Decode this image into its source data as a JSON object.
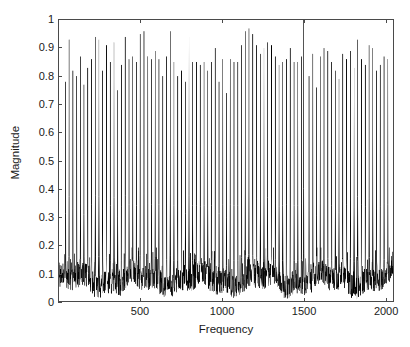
{
  "chart_data": {
    "type": "line",
    "title": "",
    "subtitle": "",
    "xlabel": "Frequency",
    "ylabel": "Magnitude",
    "xlim": [
      0,
      2048
    ],
    "ylim": [
      0,
      1
    ],
    "grid": false,
    "legend": null,
    "annotations": [],
    "series_color": "#000000",
    "axis_color": "#4a4a4a",
    "xticks": [
      500,
      1000,
      1500,
      2000
    ],
    "xtick_labels": [
      "500",
      "1000",
      "1500",
      "2000"
    ],
    "yticks": [
      0,
      0.1,
      0.2,
      0.3,
      0.4,
      0.5,
      0.6,
      0.7,
      0.8,
      0.9,
      1
    ],
    "ytick_labels": [
      "0",
      "0.1",
      "0.2",
      "0.3",
      "0.4",
      "0.5",
      "0.6",
      "0.7",
      "0.8",
      "0.9",
      "1"
    ],
    "noise_floor": {
      "mean": 0.075,
      "min": 0.005,
      "max": 0.19,
      "n_points": 2048
    },
    "peaks": {
      "comment": "Narrow spectral lines. x = Frequency bin, y = Magnitude.",
      "x": [
        40,
        62,
        85,
        108,
        131,
        153,
        176,
        199,
        222,
        245,
        268,
        291,
        314,
        337,
        360,
        383,
        406,
        429,
        452,
        475,
        498,
        521,
        544,
        567,
        590,
        613,
        636,
        659,
        682,
        705,
        728,
        751,
        774,
        797,
        820,
        843,
        866,
        889,
        912,
        935,
        958,
        981,
        1004,
        1027,
        1050,
        1073,
        1096,
        1119,
        1142,
        1165,
        1188,
        1211,
        1234,
        1257,
        1280,
        1303,
        1326,
        1349,
        1372,
        1395,
        1418,
        1441,
        1464,
        1487,
        1500,
        1533,
        1556,
        1579,
        1602,
        1625,
        1648,
        1671,
        1694,
        1717,
        1740,
        1763,
        1786,
        1809,
        1832,
        1855,
        1878,
        1901,
        1924,
        1947,
        1970,
        1993,
        2016
      ],
      "y": [
        0.78,
        0.93,
        0.82,
        0.8,
        0.87,
        0.77,
        0.83,
        0.86,
        0.94,
        0.93,
        0.82,
        0.91,
        0.85,
        0.92,
        0.75,
        0.84,
        0.94,
        0.86,
        0.87,
        0.85,
        0.95,
        0.96,
        0.87,
        0.86,
        0.89,
        0.86,
        0.8,
        0.87,
        0.96,
        0.85,
        0.8,
        0.82,
        0.78,
        0.94,
        0.85,
        0.85,
        0.84,
        0.85,
        0.82,
        0.85,
        0.9,
        0.78,
        0.86,
        0.74,
        0.86,
        0.85,
        0.85,
        0.91,
        0.96,
        0.97,
        0.95,
        0.91,
        0.88,
        0.9,
        0.92,
        0.91,
        0.87,
        0.84,
        0.85,
        0.86,
        0.9,
        0.85,
        0.85,
        0.87,
        1.0,
        0.8,
        0.88,
        0.76,
        0.87,
        0.9,
        0.89,
        0.85,
        0.82,
        0.79,
        0.88,
        0.86,
        0.89,
        0.83,
        0.93,
        0.86,
        0.84,
        0.91,
        0.9,
        0.82,
        0.84,
        0.87,
        0.86
      ]
    }
  }
}
